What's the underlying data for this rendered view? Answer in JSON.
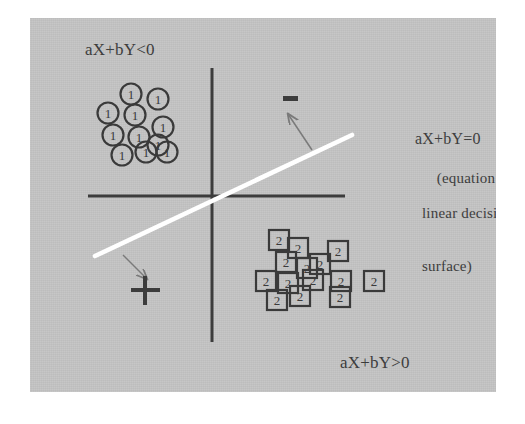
{
  "figure": {
    "background_color": "#ffffff",
    "plate_color": "#c4c4c4",
    "ink_color": "#3a3a3a",
    "decision_line_color": "#ffffff",
    "arrow_color": "#7a7a7a"
  },
  "labels": {
    "negative_region": "aX+bY<0",
    "positive_region": "aX+bY>0",
    "equation": "aX+bY=0",
    "equation_note_line1": "(equation of the",
    "equation_note_line2": "linear decision",
    "equation_note_line3": "surface)",
    "minus_sign": "−",
    "plus_sign": "+"
  },
  "chart_data": {
    "type": "scatter",
    "title": "Linear decision surface",
    "xlabel": "X",
    "ylabel": "Y",
    "grid": false,
    "legend_position": "none",
    "axes": {
      "origin": [
        212,
        196
      ],
      "x_axis": {
        "x1": 88,
        "y1": 196,
        "x2": 345,
        "y2": 196
      },
      "y_axis": {
        "x1": 212,
        "y1": 68,
        "x2": 212,
        "y2": 342
      }
    },
    "decision_boundary": {
      "label": "aX+bY=0",
      "color": "#ffffff",
      "x1": 95,
      "y1": 256,
      "x2": 352,
      "y2": 135
    },
    "annotations": [
      {
        "name": "minus-side",
        "text": "−",
        "x": 290,
        "y": 100,
        "arrow_from": [
          312,
          150
        ],
        "arrow_to": [
          288,
          114
        ]
      },
      {
        "name": "plus-side",
        "text": "+",
        "x": 145,
        "y": 291,
        "arrow_from": [
          123,
          255
        ],
        "arrow_to": [
          147,
          279
        ]
      }
    ],
    "series": [
      {
        "name": "1",
        "marker": "circle",
        "class_label": "1",
        "region": "aX+bY<0",
        "points": [
          {
            "x": 108,
            "y": 113
          },
          {
            "x": 131,
            "y": 94
          },
          {
            "x": 135,
            "y": 115
          },
          {
            "x": 158,
            "y": 99
          },
          {
            "x": 113,
            "y": 135
          },
          {
            "x": 139,
            "y": 137
          },
          {
            "x": 163,
            "y": 127
          },
          {
            "x": 122,
            "y": 155
          },
          {
            "x": 146,
            "y": 152
          },
          {
            "x": 158,
            "y": 145
          },
          {
            "x": 167,
            "y": 152
          }
        ]
      },
      {
        "name": "2",
        "marker": "square",
        "class_label": "2",
        "region": "aX+bY>0",
        "points": [
          {
            "x": 279,
            "y": 240
          },
          {
            "x": 298,
            "y": 248
          },
          {
            "x": 338,
            "y": 251
          },
          {
            "x": 286,
            "y": 262
          },
          {
            "x": 307,
            "y": 268
          },
          {
            "x": 320,
            "y": 264
          },
          {
            "x": 266,
            "y": 281
          },
          {
            "x": 288,
            "y": 283
          },
          {
            "x": 313,
            "y": 280
          },
          {
            "x": 341,
            "y": 281
          },
          {
            "x": 374,
            "y": 281
          },
          {
            "x": 277,
            "y": 300
          },
          {
            "x": 300,
            "y": 296
          },
          {
            "x": 340,
            "y": 297
          }
        ]
      }
    ]
  }
}
